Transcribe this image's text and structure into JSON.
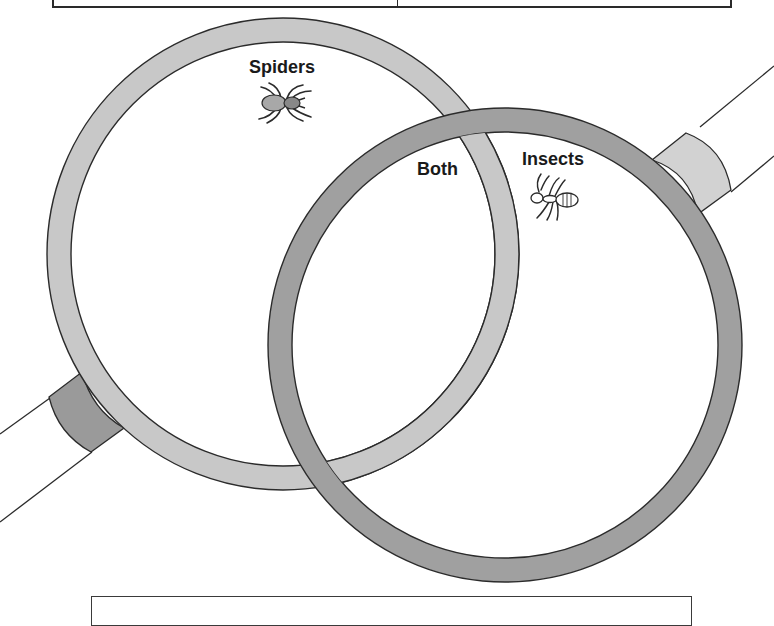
{
  "diagram": {
    "type": "venn",
    "style": "magnifying-glasses",
    "sets": [
      {
        "id": "left",
        "label": "Spiders",
        "icon": "spider-icon",
        "ring_color": "#c8c8c8",
        "ferrule_color": "#9a9a9a"
      },
      {
        "id": "right",
        "label": "Insects",
        "icon": "ant-icon",
        "ring_color": "#a0a0a0",
        "ferrule_color": "#d2d2d2"
      }
    ],
    "intersection": {
      "label": "Both"
    }
  },
  "colors": {
    "outline": "#2b2b2b",
    "light_ring": "#c8c8c8",
    "dark_ring": "#a0a0a0",
    "background": "#ffffff"
  }
}
